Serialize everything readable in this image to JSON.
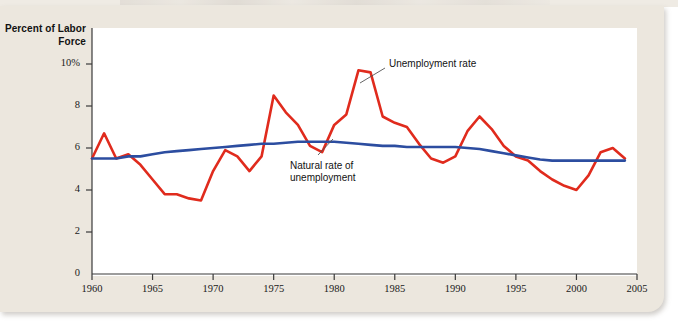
{
  "figure": {
    "y_axis_title": "Percent of\nLabor Force",
    "y_tick_labels": [
      "10%",
      "8",
      "6",
      "4",
      "2",
      "0"
    ],
    "x_tick_labels": [
      "1960",
      "1965",
      "1970",
      "1975",
      "1980",
      "1985",
      "1990",
      "1995",
      "2000",
      "2005"
    ],
    "annotations": {
      "unemployment_rate": "Unemployment rate",
      "natural_rate": "Natural rate of\nunemployment"
    },
    "colors": {
      "unemployment_rate": "#e02b1d",
      "natural_rate": "#2c4da0",
      "paper": "#ece7de",
      "panel": "#ffffff",
      "axis": "#3a3a3a"
    }
  },
  "chart_data": {
    "type": "line",
    "title": "",
    "xlabel": "",
    "ylabel": "Percent of Labor Force",
    "xlim": [
      1960,
      2005
    ],
    "ylim": [
      0,
      11
    ],
    "yticks": [
      0,
      2,
      4,
      6,
      8,
      10
    ],
    "xticks": [
      1960,
      1965,
      1970,
      1975,
      1980,
      1985,
      1990,
      1995,
      2000,
      2005
    ],
    "grid": false,
    "legend": "annotations-inline",
    "x": [
      1960,
      1961,
      1962,
      1963,
      1964,
      1965,
      1966,
      1967,
      1968,
      1969,
      1970,
      1971,
      1972,
      1973,
      1974,
      1975,
      1976,
      1977,
      1978,
      1979,
      1980,
      1981,
      1982,
      1983,
      1984,
      1985,
      1986,
      1987,
      1988,
      1989,
      1990,
      1991,
      1992,
      1993,
      1994,
      1995,
      1996,
      1997,
      1998,
      1999,
      2000,
      2001,
      2002,
      2003,
      2004
    ],
    "series": [
      {
        "name": "Unemployment rate",
        "color": "#e02b1d",
        "values": [
          5.5,
          6.7,
          5.5,
          5.7,
          5.2,
          4.5,
          3.8,
          3.8,
          3.6,
          3.5,
          4.9,
          5.9,
          5.6,
          4.9,
          5.6,
          8.5,
          7.7,
          7.1,
          6.1,
          5.8,
          7.1,
          7.6,
          9.7,
          9.6,
          7.5,
          7.2,
          7.0,
          6.2,
          5.5,
          5.3,
          5.6,
          6.8,
          7.5,
          6.9,
          6.1,
          5.6,
          5.4,
          4.9,
          4.5,
          4.2,
          4.0,
          4.7,
          5.8,
          6.0,
          5.5
        ]
      },
      {
        "name": "Natural rate of unemployment",
        "color": "#2c4da0",
        "values": [
          5.5,
          5.5,
          5.5,
          5.6,
          5.6,
          5.7,
          5.8,
          5.85,
          5.9,
          5.95,
          6.0,
          6.05,
          6.1,
          6.15,
          6.2,
          6.2,
          6.25,
          6.3,
          6.3,
          6.3,
          6.3,
          6.25,
          6.2,
          6.15,
          6.1,
          6.1,
          6.05,
          6.05,
          6.05,
          6.05,
          6.05,
          6.0,
          5.95,
          5.85,
          5.75,
          5.65,
          5.55,
          5.45,
          5.4,
          5.4,
          5.4,
          5.4,
          5.4,
          5.4,
          5.4
        ]
      }
    ]
  }
}
